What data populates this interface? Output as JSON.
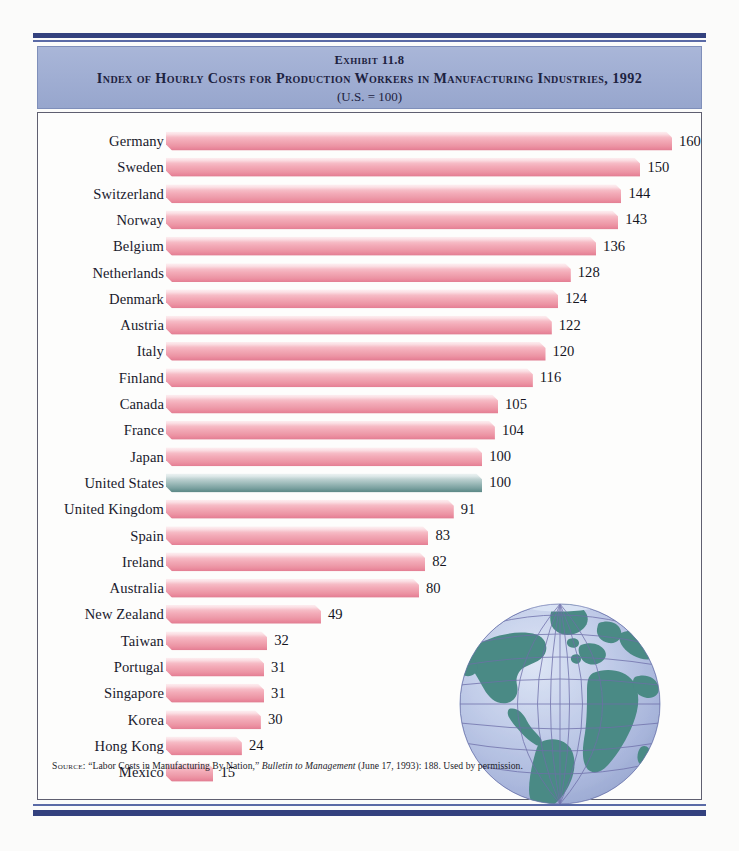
{
  "header": {
    "exhibit": "Exhibit 11.8",
    "title": "Index of Hourly Costs for Production Workers in Manufacturing Industries, 1992",
    "subtitle": "(U.S. = 100)"
  },
  "source": {
    "prefix": "Source:",
    "article": "“Labor Costs in Manufacturing By Nation,”",
    "publication": "Bulletin to Management",
    "details": "(June 17, 1993): 188. Used by permission."
  },
  "colors": {
    "rule_navy": "#33417e",
    "header_band": "#a0aed3",
    "bar_pink": "#f3aab7",
    "bar_pink_shade": "#e07c90",
    "bar_highlight_teal": "#8fb0af",
    "bar_highlight_teal_shade": "#5a8684",
    "panel_background": "#fdfdfc",
    "page_background": "#fbfbfa",
    "globe_ocean": "#b8c4e2",
    "globe_land": "#4a8a85",
    "globe_grid": "#6d6ea8",
    "text": "#1a1a2c"
  },
  "globe": {
    "label": "world-globe-illustration"
  },
  "chart_data": {
    "type": "bar",
    "orientation": "horizontal",
    "title": "Index of Hourly Costs for Production Workers in Manufacturing Industries, 1992",
    "subtitle": "(U.S. = 100)",
    "xlabel": "",
    "ylabel": "",
    "xlim": [
      0,
      160
    ],
    "grid": false,
    "legend": null,
    "highlight_category": "United States",
    "categories": [
      "Germany",
      "Sweden",
      "Switzerland",
      "Norway",
      "Belgium",
      "Netherlands",
      "Denmark",
      "Austria",
      "Italy",
      "Finland",
      "Canada",
      "France",
      "Japan",
      "United States",
      "United Kingdom",
      "Spain",
      "Ireland",
      "Australia",
      "New Zealand",
      "Taiwan",
      "Portugal",
      "Singapore",
      "Korea",
      "Hong Kong",
      "Mexico"
    ],
    "values": [
      160,
      150,
      144,
      143,
      136,
      128,
      124,
      122,
      120,
      116,
      105,
      104,
      100,
      100,
      91,
      83,
      82,
      80,
      49,
      32,
      31,
      31,
      30,
      24,
      15
    ]
  }
}
